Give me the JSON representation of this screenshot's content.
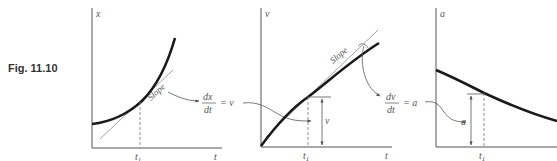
{
  "figure": {
    "label": "Fig. 11.10",
    "colors": {
      "curve": "#1a1a1a",
      "axis": "#555555",
      "thin": "#888888",
      "text": "#555555"
    }
  },
  "graphs": [
    {
      "id": "position",
      "y_axis_label": "x",
      "x_axis_label": "t",
      "marker_label": "t",
      "marker_sub": "1",
      "slope_label": "Slope"
    },
    {
      "id": "velocity",
      "y_axis_label": "v",
      "x_axis_label": "t",
      "marker_label": "t",
      "marker_sub": "1",
      "slope_label": "Slope",
      "value_label": "v"
    },
    {
      "id": "acceleration",
      "y_axis_label": "a",
      "x_axis_label": "t",
      "marker_label": "t",
      "marker_sub": "1",
      "value_label": "a"
    }
  ],
  "relations": [
    {
      "numerator": "dx",
      "denominator": "dt",
      "equals": "= v"
    },
    {
      "numerator": "dv",
      "denominator": "dt",
      "equals": "= a"
    }
  ]
}
